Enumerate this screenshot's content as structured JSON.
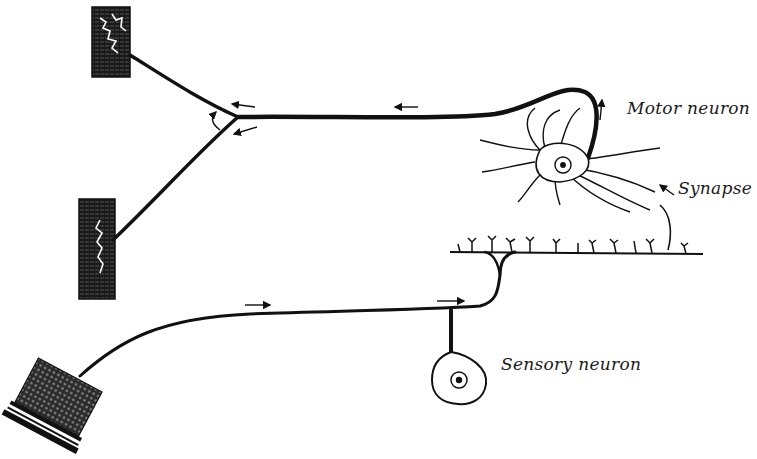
{
  "diagram": {
    "type": "reflex-arc",
    "labels": {
      "motor_neuron": "Motor neuron",
      "synapse": "Synapse",
      "sensory_neuron": "Sensory neuron"
    },
    "colors": {
      "ink": "#111111",
      "background": "#ffffff"
    },
    "elements": [
      {
        "name": "muscle-upper",
        "kind": "effector muscle block"
      },
      {
        "name": "muscle-middle",
        "kind": "effector muscle block"
      },
      {
        "name": "skin-receptor",
        "kind": "sensory receptor (skin)"
      },
      {
        "name": "motor-neuron",
        "kind": "multipolar neuron with cell body and nucleus"
      },
      {
        "name": "sensory-neuron",
        "kind": "unipolar neuron with cell body and nucleus"
      },
      {
        "name": "spinal-collateral",
        "kind": "horizontal axon with terminal branches"
      }
    ]
  }
}
